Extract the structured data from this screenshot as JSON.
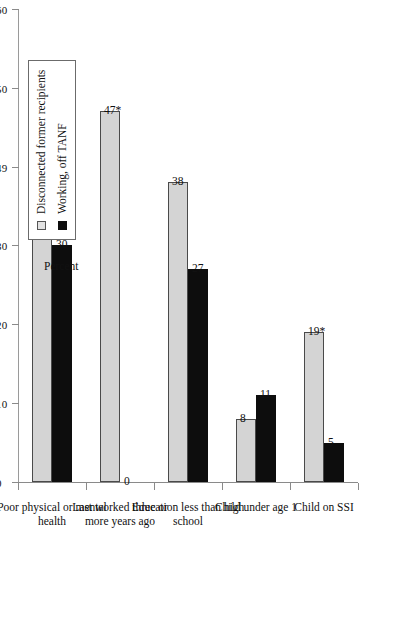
{
  "chart_data": {
    "type": "bar",
    "title": "",
    "subtitle": "",
    "xlabel": "",
    "ylabel": "Percent",
    "ylim": [
      0,
      60
    ],
    "yticks": [
      0,
      10,
      20,
      30,
      40,
      50,
      60
    ],
    "ytick_labels": [
      "0",
      "10",
      "20",
      "30",
      "49",
      "50",
      "60"
    ],
    "grid": false,
    "orientation": "vertical-bars-page-rotated-90ccw",
    "legend_position": "upper-right-of-plot",
    "categories": [
      "Poor physical or mental\nhealth",
      "Last worked three or\nmore years ago",
      "Education less than high\nschool",
      "Child under age 1",
      "Child on SSI"
    ],
    "series": [
      {
        "name": "Disconnected former recipients",
        "color": "#d4d4d4",
        "values": [
          50,
          47,
          38,
          8,
          19
        ],
        "labels": [
          "50*",
          "47*",
          "38",
          "8",
          "19*"
        ]
      },
      {
        "name": "Working, off TANF",
        "color": "#0d0d0d",
        "values": [
          30,
          0,
          27,
          11,
          5
        ],
        "labels": [
          "30",
          "0",
          "27",
          "11",
          "5"
        ]
      }
    ],
    "annotations": [
      "* denotes a statistically significant difference"
    ]
  },
  "legend": {
    "items": [
      {
        "label": "Disconnected former recipients",
        "swatch": "light-square-swatch"
      },
      {
        "label": "Working, off TANF",
        "swatch": "dark-square-swatch"
      }
    ]
  },
  "axis": {
    "percent_title": "Percent"
  }
}
